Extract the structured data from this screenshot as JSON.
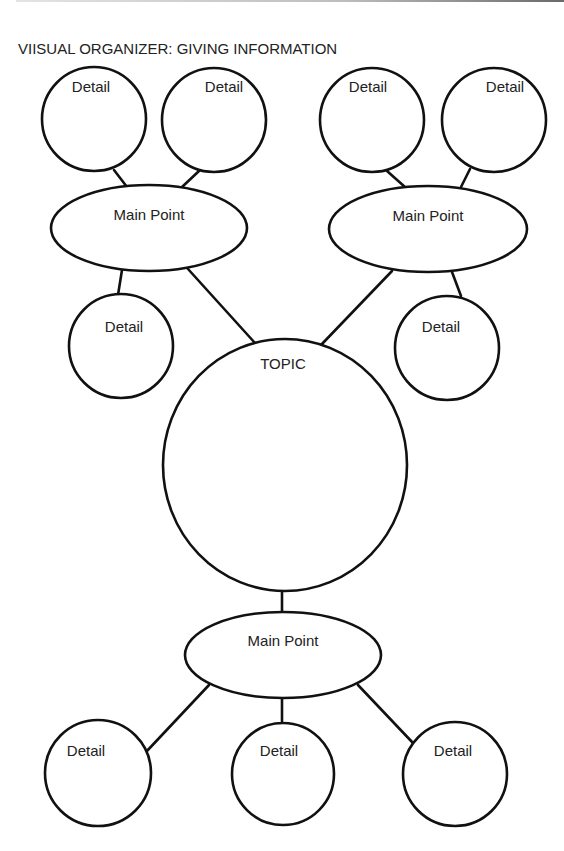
{
  "title": "VIISUAL ORGANIZER: GIVING INFORMATION",
  "colors": {
    "stroke": "#111111",
    "text": "#222222",
    "background": "#ffffff"
  },
  "topic": {
    "label": "TOPIC"
  },
  "main_points": [
    {
      "id": "main-point-top-left",
      "label": "Main Point",
      "details": [
        {
          "label": "Detail"
        },
        {
          "label": "Detail"
        },
        {
          "label": "Detail"
        }
      ]
    },
    {
      "id": "main-point-top-right",
      "label": "Main Point",
      "details": [
        {
          "label": "Detail"
        },
        {
          "label": "Detail"
        },
        {
          "label": "Detail"
        }
      ]
    },
    {
      "id": "main-point-bottom",
      "label": "Main Point",
      "details": [
        {
          "label": "Detail"
        },
        {
          "label": "Detail"
        },
        {
          "label": "Detail"
        }
      ]
    }
  ]
}
